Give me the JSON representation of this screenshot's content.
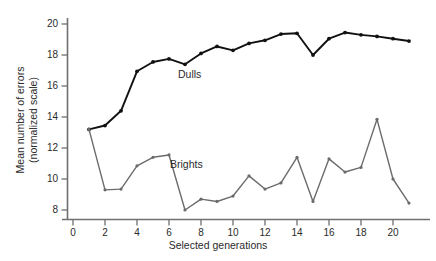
{
  "chart_data": {
    "type": "line",
    "title": "",
    "xlabel": "Selected generations",
    "ylabel": "Mean number of errors (normalized scale)",
    "ylabel_line1": "Mean number of errors",
    "ylabel_line2": "(normalized scale)",
    "xlim": [
      -0.35,
      21.6
    ],
    "ylim": [
      7.2,
      20.6
    ],
    "xticks": [
      0,
      2,
      4,
      6,
      8,
      10,
      12,
      14,
      16,
      18,
      20
    ],
    "xtick_labels": [
      "0",
      "2",
      "4",
      "6",
      "8",
      "10",
      "12",
      "14",
      "16",
      "18",
      "20"
    ],
    "yticks": [
      8,
      10,
      12,
      14,
      16,
      18,
      20
    ],
    "ytick_labels": [
      "8",
      "10",
      "12",
      "14",
      "16",
      "18",
      "20"
    ],
    "grid": false,
    "legend_position": "inline-annotation",
    "x": [
      1,
      2,
      3,
      4,
      5,
      6,
      7,
      8,
      9,
      10,
      11,
      12,
      13,
      14,
      15,
      16,
      17,
      18,
      19,
      20,
      21
    ],
    "series": [
      {
        "name": "Dulls",
        "color": "#111111",
        "marker": "filled-circle",
        "values": [
          13.2,
          13.45,
          14.4,
          16.95,
          17.55,
          17.75,
          17.4,
          18.1,
          18.55,
          18.3,
          18.75,
          18.95,
          19.35,
          19.4,
          18.0,
          19.05,
          19.45,
          19.3,
          19.2,
          19.05,
          18.9
        ]
      },
      {
        "name": "Brights",
        "color": "#6b6b6b",
        "marker": "filled-circle",
        "values": [
          13.2,
          9.3,
          9.35,
          10.85,
          11.4,
          11.55,
          8.0,
          8.7,
          8.55,
          8.9,
          10.2,
          9.35,
          9.75,
          11.4,
          8.55,
          11.3,
          10.45,
          10.75,
          13.85,
          10.0,
          8.45
        ]
      }
    ],
    "annotations": [
      {
        "text": "Dulls",
        "x": 7.6,
        "y": 17.55
      },
      {
        "text": "Brights",
        "x": 7.1,
        "y": 11.3
      }
    ]
  },
  "axis": {
    "x_title": "Selected generations",
    "y_title_line1": "Mean number of errors",
    "y_title_line2": "(normalized scale)"
  }
}
